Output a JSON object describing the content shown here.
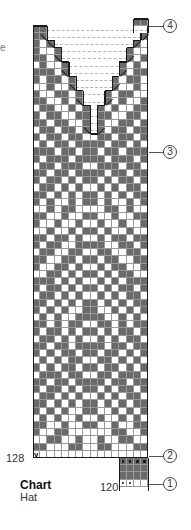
{
  "caption": {
    "title": "Chart",
    "subtitle": "Hat",
    "clipped_text": "e"
  },
  "row_labels": [
    {
      "label": "128",
      "row_index": 59
    },
    {
      "label": "120",
      "block_row": 3
    }
  ],
  "callouts": [
    {
      "number": "4",
      "y": 26
    },
    {
      "number": "3",
      "y": 152
    },
    {
      "number": "2",
      "y": 456
    },
    {
      "number": "1",
      "y": 484
    }
  ],
  "legend_colors": {
    "dark": "#6a6a6a",
    "light": "#ffffff",
    "grid_line": "#9a9a9a",
    "outline": "#1a1a1a"
  },
  "grid": {
    "cols": 16,
    "cell": 7.2,
    "rows": [
      "DD..............",
      "DD.............D",
      "DWD...........DW",
      "DWWD.........DWW",
      "DDWD.........DWD",
      "WDWWD.......DWDW",
      "DDDWD.......DWDD",
      "DWDDWD.....DWDDW",
      "WWDWWD.....DWWDW",
      "DWWDDWD...DWDDWW",
      "DDWWDWD...DWDWWD",
      "WDDWWDWD.DWDWWDD",
      "DWDDWWDD.DDWWDDW",
      "DDWDDWWD.DWWDDWD",
      "WDDWDDWD.DWDDWDD",
      "DWDDWDDWWDDWDDWD",
      "WDWDDWDDDDWDDWDW",
      "DDDWDDWDDWDDWDDD",
      "DWDDDWDDDDWDDDWD",
      "WDDWDDDWWDDDWDDW",
      "DDWDDWDDDDWDDWDD",
      "DWDDWDWDDWDWDDWD",
      "WDDWDWDWWDWDWDDW",
      "DDWDWDWDDWDWDWDD",
      "DWDWWDWDDWDWWDWD",
      "WWDWDDWWWWDDWDWW",
      "DDWWDWWDDWWDWWDD",
      "DWWDWWDWWDWWDWWD",
      "WWDWWDWDDWDWWDWW",
      "DDWDDWDWWDWDDWDD",
      "DWDDWWDDDDWWDDWD",
      "WDDWWDDWWDDWWDDW",
      "DDWWDDWDDWDDWWDD",
      "DWWDDWDWWDWDDWWD",
      "WWDDWDWDDWDWDDWW",
      "DDDWDWDWWDWDWDDD",
      "DWDDWDWDDWDWDDWD",
      "WDDWDWDWWDWDWDDW",
      "DDWDWDWDDWDWDWDD",
      "DWDWDWWDDWWDWDWD",
      "WDWDWWDDDDWWDWDW",
      "DDWDWDDWWDDWDWDD",
      "DWDDWDWDDWDWDDWD",
      "WDDWDWDWWDWDWDDW",
      "DDWDDWDDDDWDDWDD",
      "DWDWDDWDDWDDWDWD",
      "WDWDWDDWWDDWDWDW",
      "DWDWDDWDDWDDWDWD",
      "WDDDWDDWWDDWDDDW",
      "DDWDDWDDDDWDDWDD",
      "DWDDWDWDDWDWDDWD",
      "WDDWDWDWWDWDWDDW",
      "DDWDWDWDDWDWDWDD",
      "DWDWDWWDDWWDWDWD",
      "WDWDWWDWWDWWDWDW",
      "DDWWDWWDDWWDWWDD",
      "DWWDDWWWWWWDDWWD",
      "WWDDWWDWWDWWDDWW",
      "DDWWWDDWWDDWWWDD",
      "VWWWWWWWWWWWWWWW"
    ],
    "rib_block": {
      "col_start": 12,
      "cols": 4,
      "rows": [
        "PPPP",
        "DDDD",
        "DDDD",
        "PPWW"
      ]
    }
  }
}
